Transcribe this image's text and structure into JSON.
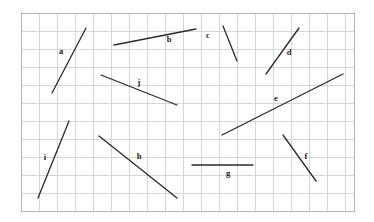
{
  "figure": {
    "background_color": "#ffffff",
    "grid": {
      "line_color": "#d6d6d6",
      "border_color": "#b4b4b4",
      "x_start": 21,
      "y_start": 13,
      "x_end": 354,
      "y_end": 211,
      "cell_width": 18,
      "cell_height": 18,
      "columns": 18.5,
      "rows": 11
    },
    "segment_style": {
      "stroke_color": "#2b2b2b",
      "stroke_width": 1.3
    },
    "segments": [
      {
        "id": "a",
        "label": "a",
        "x1": 52,
        "y1": 93,
        "x2": 86,
        "y2": 28,
        "label_x": 61,
        "label_y": 54
      },
      {
        "id": "b",
        "label": "b",
        "x1": 114,
        "y1": 45,
        "x2": 196,
        "y2": 29,
        "label_x": 169,
        "label_y": 42
      },
      {
        "id": "c",
        "label": "c",
        "x1": 223,
        "y1": 26,
        "x2": 237,
        "y2": 61,
        "label_x": 208,
        "label_y": 38
      },
      {
        "id": "d",
        "label": "d",
        "x1": 266,
        "y1": 74,
        "x2": 299,
        "y2": 28,
        "label_x": 289,
        "label_y": 55
      },
      {
        "id": "e",
        "label": "e",
        "x1": 222,
        "y1": 135,
        "x2": 343,
        "y2": 74,
        "label_x": 276,
        "label_y": 101
      },
      {
        "id": "f",
        "label": "f",
        "x1": 283,
        "y1": 135,
        "x2": 316,
        "y2": 181,
        "label_x": 306,
        "label_y": 159
      },
      {
        "id": "g",
        "label": "g",
        "x1": 192,
        "y1": 165,
        "x2": 253,
        "y2": 165,
        "label_x": 228,
        "label_y": 176
      },
      {
        "id": "h",
        "label": "h",
        "x1": 99,
        "y1": 136,
        "x2": 177,
        "y2": 198,
        "label_x": 139,
        "label_y": 159
      },
      {
        "id": "i",
        "label": "i",
        "x1": 38,
        "y1": 198,
        "x2": 69,
        "y2": 121,
        "label_x": 45,
        "label_y": 160
      },
      {
        "id": "j",
        "label": "j",
        "x1": 101,
        "y1": 75,
        "x2": 177,
        "y2": 105,
        "label_x": 139,
        "label_y": 85
      }
    ]
  }
}
